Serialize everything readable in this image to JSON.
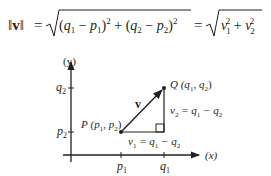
{
  "formula": {
    "lhs": "‖v‖",
    "eq": "=",
    "radicand1": "(q₁ − p₁)² + (q₂ − p₂)²",
    "radicand2": "v₁² + v₂²",
    "lhs_parts": {
      "bar_left": "‖",
      "v": "v",
      "bar_right": "‖"
    },
    "rad1_parts": {
      "open1": "(",
      "q": "q",
      "one": "1",
      "minus": "−",
      "p": "p",
      "close1": ")",
      "sq": "2",
      "plus": "+",
      "open2": "(",
      "q2": "q",
      "two": "2",
      "minus2": "−",
      "p2": "p",
      "close2": ")",
      "sq2": "2"
    },
    "rad2_parts": {
      "v": "v",
      "one": "1",
      "sq": "2",
      "plus": "+",
      "v2": "v",
      "two": "2",
      "sq2": "2"
    }
  },
  "diagram": {
    "y_axis_label": "(y)",
    "x_axis_label": "(x)",
    "y_ticks": [
      {
        "label": "q",
        "sub": "2"
      },
      {
        "label": "p",
        "sub": "2"
      }
    ],
    "x_ticks": [
      {
        "label": "p",
        "sub": "1"
      },
      {
        "label": "q",
        "sub": "1"
      }
    ],
    "point_p": {
      "name": "P",
      "coords_text": "(p",
      "sub1": "1",
      "sep": ", p",
      "sub2": "2",
      "close": ")"
    },
    "point_q": {
      "name": "Q",
      "coords_text": "(q",
      "sub1": "1",
      "sep": ", q",
      "sub2": "2",
      "close": ")"
    },
    "vector_label": "v",
    "v1_label": {
      "v": "v",
      "vsub": "1",
      "eq": " = q",
      "sub_a": "1",
      "minus": " − q",
      "sub_b": "2"
    },
    "v2_label": {
      "v": "v",
      "vsub": "2",
      "eq": " = q",
      "sub_a": "1",
      "minus": " − q",
      "sub_b": "2"
    },
    "colors": {
      "ink": "#231f20",
      "background": "#ffffff"
    }
  }
}
